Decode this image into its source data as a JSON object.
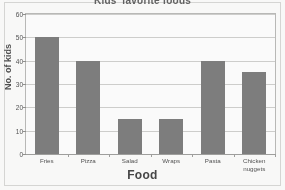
{
  "chart_data": {
    "type": "bar",
    "title": "Kids' favorite foods",
    "xlabel": "Food",
    "ylabel": "No. of kids",
    "categories": [
      "Fries",
      "Pizza",
      "Salad",
      "Wraps",
      "Pasta",
      "Chicken\nnuggets"
    ],
    "values": [
      50,
      40,
      15,
      15,
      40,
      35
    ],
    "ylim": [
      0,
      60
    ],
    "ytick_labels": [
      "0",
      "10",
      "20",
      "30",
      "40",
      "50",
      "60"
    ],
    "ytick_values": [
      0,
      10,
      20,
      30,
      40,
      50,
      60
    ],
    "grid": true,
    "legend": false,
    "bar_color": "#7a7a7a",
    "gridline_color": "#cfcfcd",
    "axis_color": "#9d9d9b",
    "plot_background": "#ffffff"
  }
}
